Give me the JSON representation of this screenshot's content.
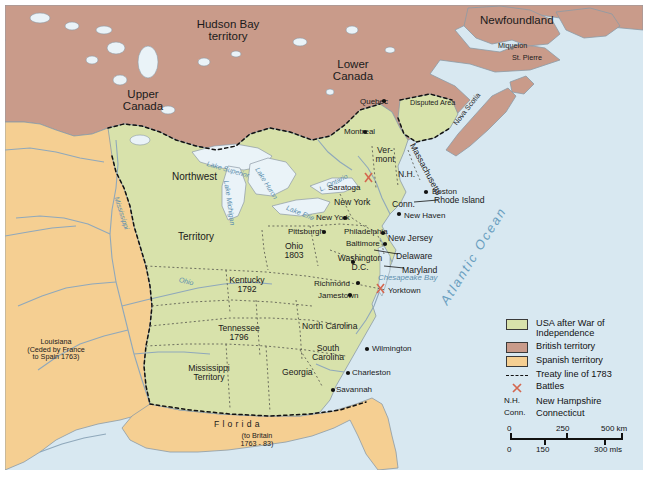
{
  "map": {
    "title": "USA after the War of Independence, 1783",
    "colors": {
      "usa": "#d8e2ab",
      "british": "#c99b8a",
      "spanish": "#f5cf92",
      "water": "#d8e8f1",
      "land_outline": "#8c9aa6",
      "treaty_line": "#111111",
      "battle_marker": "#d4674f",
      "ocean_label": "#6a9fc0"
    },
    "territories": [
      {
        "name": "Hudson Bay territory",
        "x": 228,
        "y": 24,
        "class": "region ctr"
      },
      {
        "name": "Lower\nCanada",
        "x": 326,
        "y": 63,
        "class": "region ctr"
      },
      {
        "name": "Upper\nCanada",
        "x": 122,
        "y": 95,
        "class": "region ctr"
      },
      {
        "name": "Newfoundland",
        "x": 488,
        "y": 17,
        "class": "region ctr"
      },
      {
        "name": "Northwest",
        "x": 175,
        "y": 175,
        "class": "region2 ctr"
      },
      {
        "name": "Territory",
        "x": 180,
        "y": 238,
        "class": "region2 ctr"
      },
      {
        "name": "Louisiana\n(Ceded by France\nto Spain 1763)",
        "x": 38,
        "y": 341,
        "class": "small ctr"
      },
      {
        "name": "Mississippi\nTerritory",
        "x": 206,
        "y": 368,
        "class": "state ctr"
      },
      {
        "name": "Disputed Area",
        "x": 415,
        "y": 103,
        "class": "small"
      },
      {
        "name": "Nova Scotia",
        "x": 470,
        "y": 120,
        "class": "small",
        "rotate": -52
      },
      {
        "name": "Miquelon",
        "x": 504,
        "y": 43,
        "class": "small"
      },
      {
        "name": "St. Pierre",
        "x": 522,
        "y": 55,
        "class": "small"
      }
    ],
    "states": [
      {
        "name": "Ver-\nmont",
        "x": 380,
        "y": 150,
        "class": "state ctr"
      },
      {
        "name": "N.H.",
        "x": 404,
        "y": 170,
        "class": "state"
      },
      {
        "name": "Massachusetts",
        "x": 425,
        "y": 146,
        "class": "state",
        "rotate": 62
      },
      {
        "name": "New York",
        "x": 340,
        "y": 199,
        "class": "state"
      },
      {
        "name": "Conn.",
        "x": 399,
        "y": 200,
        "class": "state"
      },
      {
        "name": "Rhode Island",
        "x": 440,
        "y": 198,
        "class": "state"
      },
      {
        "name": "New Jersey",
        "x": 393,
        "y": 237,
        "class": "state"
      },
      {
        "name": "Delaware",
        "x": 402,
        "y": 255,
        "class": "state"
      },
      {
        "name": "Maryland",
        "x": 406,
        "y": 268,
        "class": "state"
      },
      {
        "name": "Ohio\n1803",
        "x": 288,
        "y": 246,
        "class": "state ctr"
      },
      {
        "name": "Kentucky\n1792",
        "x": 236,
        "y": 279,
        "class": "state ctr"
      },
      {
        "name": "Tennessee\n1796",
        "x": 228,
        "y": 328,
        "class": "state ctr"
      },
      {
        "name": "North Carolina",
        "x": 310,
        "y": 325,
        "class": "state"
      },
      {
        "name": "South\nCarolina",
        "x": 320,
        "y": 347,
        "class": "state ctr"
      },
      {
        "name": "Georgia",
        "x": 290,
        "y": 371,
        "class": "state"
      },
      {
        "name": "F l o r i d a",
        "x": 222,
        "y": 424,
        "class": "state"
      },
      {
        "name": "(to Britain\n1763 - 83)",
        "x": 244,
        "y": 434,
        "class": "small ctr"
      }
    ],
    "cities": [
      {
        "name": "Quebec",
        "x": 383,
        "y": 101,
        "dot": true
      },
      {
        "name": "Montreal",
        "x": 363,
        "y": 131,
        "dot": true
      },
      {
        "name": "Saratoga",
        "x": 336,
        "y": 186,
        "dot": false
      },
      {
        "name": "Boston",
        "x": 432,
        "y": 190,
        "dot": true
      },
      {
        "name": "New Haven",
        "x": 411,
        "y": 213,
        "dot": false
      },
      {
        "name": "New York",
        "x": 345,
        "y": 216,
        "dot": true
      },
      {
        "name": "Pittsburgh",
        "x": 299,
        "y": 231,
        "dot": true
      },
      {
        "name": "Philadelphia",
        "x": 355,
        "y": 232,
        "dot": true
      },
      {
        "name": "Baltimore",
        "x": 351,
        "y": 242,
        "dot": true
      },
      {
        "name": "Washington\nD.C.",
        "x": 362,
        "y": 258,
        "dot": true
      },
      {
        "name": "Richmond",
        "x": 339,
        "y": 282,
        "dot": true
      },
      {
        "name": "Jamestown",
        "x": 338,
        "y": 293,
        "dot": true
      },
      {
        "name": "Yorktown",
        "x": 392,
        "y": 289,
        "dot": false
      },
      {
        "name": "Wilmington",
        "x": 370,
        "y": 348,
        "dot": true
      },
      {
        "name": "Charleston",
        "x": 352,
        "y": 372,
        "dot": true
      },
      {
        "name": "Savannah",
        "x": 336,
        "y": 389,
        "dot": true
      }
    ],
    "water_labels": [
      {
        "name": "Lake Superior",
        "x": 216,
        "y": 161,
        "rotate": 16
      },
      {
        "name": "Lake Huron",
        "x": 263,
        "y": 173,
        "rotate": 55
      },
      {
        "name": "Lake Michigan",
        "x": 235,
        "y": 185,
        "rotate": 82
      },
      {
        "name": "L. Ontario",
        "x": 325,
        "y": 182,
        "rotate": -26
      },
      {
        "name": "Lake Erie",
        "x": 296,
        "y": 206,
        "rotate": 26
      },
      {
        "name": "Ohio",
        "x": 186,
        "y": 279,
        "rotate": 16
      },
      {
        "name": "Mississippi",
        "x": 123,
        "y": 201,
        "rotate": 70
      },
      {
        "name": "Chesapeake Bay",
        "x": 383,
        "y": 277,
        "rotate": 0
      },
      {
        "name": "Atlantic Ocean",
        "x": 472,
        "y": 256,
        "rotate": -58,
        "big": true
      }
    ],
    "battles": [
      {
        "name": "Saratoga",
        "x": 368,
        "y": 176
      },
      {
        "name": "Yorktown",
        "x": 380,
        "y": 287
      }
    ]
  },
  "legend": {
    "title": "Legend",
    "entries": [
      {
        "key": "swatch",
        "color": "#d8e2ab",
        "label": "USA after War of\nIndependence",
        "name": "legend-usa"
      },
      {
        "key": "swatch",
        "color": "#c99b8a",
        "label": "British territory",
        "name": "legend-british"
      },
      {
        "key": "swatch",
        "color": "#f5cf92",
        "label": "Spanish territory",
        "name": "legend-spanish"
      },
      {
        "key": "dash",
        "color": "#111111",
        "label": "Treaty line of 1783",
        "name": "legend-treaty"
      },
      {
        "key": "battle",
        "color": "#d4674f",
        "label": "Battles",
        "name": "legend-battles"
      },
      {
        "key": "abbr",
        "abbr": "N.H.",
        "label": "New Hampshire",
        "name": "legend-nh"
      },
      {
        "key": "abbr",
        "abbr": "Conn.",
        "label": "Connecticut",
        "name": "legend-conn"
      }
    ]
  },
  "scale": {
    "km": {
      "left": "0",
      "mid": "250",
      "right": "500 km"
    },
    "miles": {
      "left": "0",
      "mid": "150",
      "right": "300 mls"
    }
  }
}
